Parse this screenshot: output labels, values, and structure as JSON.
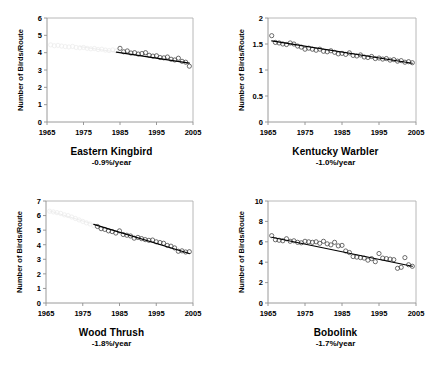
{
  "figure": {
    "type": "multi-panel-scatter",
    "panel_count": 4,
    "shared_ylabel": "Number of Birds/Route",
    "shared_xticks": [
      "1965",
      "1975",
      "1985",
      "1995",
      "2005"
    ],
    "marker_style": "open-circle",
    "line_style": "solid-linear-trend",
    "colors": {
      "marker_stroke": "#3d3d3d",
      "trend_line": "#000000",
      "axis": "#8f8f8f",
      "frame": "#b0b0b0",
      "background": "#ffffff",
      "text": "#000000"
    }
  },
  "panels": [
    {
      "id": "eastern-kingbird",
      "name": "Eastern Kingbird",
      "trend": "-0.9%/year",
      "ylabel": "Number of Birds/Route",
      "yticks": [
        "0",
        "1",
        "2",
        "3",
        "4",
        "5",
        "6"
      ]
    },
    {
      "id": "kentucky-warbler",
      "name": "Kentucky Warbler",
      "trend": "-1.0%/year",
      "ylabel": "Number of Birds/Route",
      "yticks": [
        "0",
        "0.5",
        "1",
        "1.5",
        "2"
      ]
    },
    {
      "id": "wood-thrush",
      "name": "Wood Thrush",
      "trend": "-1.8%/year",
      "ylabel": "Number of Birds/Route",
      "yticks": [
        "0",
        "1",
        "2",
        "3",
        "4",
        "5",
        "6",
        "7"
      ]
    },
    {
      "id": "bobolink",
      "name": "Bobolink",
      "trend": "-1.7%/year",
      "ylabel": "Number of Birds/Route",
      "yticks": [
        "0",
        "2",
        "4",
        "6",
        "8",
        "10"
      ]
    }
  ],
  "chart_data": [
    {
      "type": "scatter",
      "title": "Eastern Kingbird",
      "annotation": "-0.9%/year",
      "xlabel": "",
      "ylabel": "Number of Birds/Route",
      "xlim": [
        1965,
        2005
      ],
      "ylim": [
        0,
        6
      ],
      "xticks": [
        1965,
        1975,
        1985,
        1995,
        2005
      ],
      "yticks": [
        0,
        1,
        2,
        3,
        4,
        5,
        6
      ],
      "grid": false,
      "legend": null,
      "note": "left-hand portion of the series is printed very faintly",
      "x": [
        1966,
        1967,
        1968,
        1969,
        1970,
        1971,
        1972,
        1973,
        1974,
        1975,
        1976,
        1977,
        1978,
        1979,
        1980,
        1981,
        1982,
        1983,
        1984,
        1985,
        1986,
        1987,
        1988,
        1989,
        1990,
        1991,
        1992,
        1993,
        1994,
        1995,
        1996,
        1997,
        1998,
        1999,
        2000,
        2001,
        2002,
        2003,
        2004
      ],
      "y": [
        4.45,
        4.4,
        4.42,
        4.38,
        4.35,
        4.33,
        4.36,
        4.3,
        4.28,
        4.3,
        4.25,
        4.22,
        4.24,
        4.18,
        4.2,
        4.15,
        4.12,
        4.16,
        4.1,
        4.25,
        4.05,
        4.1,
        3.98,
        4.0,
        3.92,
        3.95,
        4.0,
        3.85,
        3.8,
        3.82,
        3.72,
        3.7,
        3.75,
        3.62,
        3.58,
        3.68,
        3.5,
        3.45,
        3.22
      ],
      "trend_line": {
        "x": [
          1974,
          2004
        ],
        "y": [
          4.35,
          3.4
        ]
      }
    },
    {
      "type": "scatter",
      "title": "Kentucky Warbler",
      "annotation": "-1.0%/year",
      "xlabel": "",
      "ylabel": "Number of Birds/Route",
      "xlim": [
        1965,
        2005
      ],
      "ylim": [
        0,
        2
      ],
      "xticks": [
        1965,
        1975,
        1985,
        1995,
        2005
      ],
      "yticks": [
        0,
        0.5,
        1,
        1.5,
        2
      ],
      "grid": false,
      "legend": null,
      "x": [
        1966,
        1967,
        1968,
        1969,
        1970,
        1971,
        1972,
        1973,
        1974,
        1975,
        1976,
        1977,
        1978,
        1979,
        1980,
        1981,
        1982,
        1983,
        1984,
        1985,
        1986,
        1987,
        1988,
        1989,
        1990,
        1991,
        1992,
        1993,
        1994,
        1995,
        1996,
        1997,
        1998,
        1999,
        2000,
        2001,
        2002,
        2003,
        2004
      ],
      "y": [
        1.66,
        1.53,
        1.52,
        1.5,
        1.49,
        1.52,
        1.5,
        1.46,
        1.44,
        1.4,
        1.42,
        1.4,
        1.38,
        1.4,
        1.36,
        1.35,
        1.37,
        1.34,
        1.31,
        1.32,
        1.3,
        1.33,
        1.28,
        1.27,
        1.29,
        1.25,
        1.24,
        1.26,
        1.22,
        1.23,
        1.21,
        1.22,
        1.19,
        1.2,
        1.17,
        1.18,
        1.15,
        1.16,
        1.14
      ],
      "trend_line": {
        "x": [
          1966,
          2004
        ],
        "y": [
          1.56,
          1.13
        ]
      }
    },
    {
      "type": "scatter",
      "title": "Wood Thrush",
      "annotation": "-1.8%/year",
      "xlabel": "",
      "ylabel": "Number of Birds/Route",
      "xlim": [
        1965,
        2005
      ],
      "ylim": [
        0,
        7
      ],
      "xticks": [
        1965,
        1975,
        1985,
        1995,
        2005
      ],
      "yticks": [
        0,
        1,
        2,
        3,
        4,
        5,
        6,
        7
      ],
      "grid": false,
      "legend": null,
      "note": "left-hand portion of the series is printed very faintly",
      "x": [
        1966,
        1967,
        1968,
        1969,
        1970,
        1971,
        1972,
        1973,
        1974,
        1975,
        1976,
        1977,
        1978,
        1979,
        1980,
        1981,
        1982,
        1983,
        1984,
        1985,
        1986,
        1987,
        1988,
        1989,
        1990,
        1991,
        1992,
        1993,
        1994,
        1995,
        1996,
        1997,
        1998,
        1999,
        2000,
        2001,
        2002,
        2003,
        2004
      ],
      "y": [
        6.3,
        6.25,
        6.2,
        6.15,
        6.05,
        6.0,
        5.9,
        5.8,
        5.7,
        5.6,
        5.5,
        5.42,
        5.3,
        5.25,
        5.1,
        5.05,
        4.95,
        4.9,
        4.8,
        4.95,
        4.7,
        4.65,
        4.6,
        4.45,
        4.5,
        4.42,
        4.35,
        4.3,
        4.32,
        4.2,
        4.15,
        4.1,
        3.95,
        3.9,
        3.78,
        3.55,
        3.58,
        3.5,
        3.52
      ],
      "trend_line": {
        "x": [
          1966,
          2004
        ],
        "y": [
          6.32,
          3.4
        ]
      }
    },
    {
      "type": "scatter",
      "title": "Bobolink",
      "annotation": "-1.7%/year",
      "xlabel": "",
      "ylabel": "Number of Birds/Route",
      "xlim": [
        1965,
        2005
      ],
      "ylim": [
        0,
        10
      ],
      "xticks": [
        1965,
        1975,
        1985,
        1995,
        2005
      ],
      "yticks": [
        0,
        2,
        4,
        6,
        8,
        10
      ],
      "grid": false,
      "legend": null,
      "x": [
        1966,
        1967,
        1968,
        1969,
        1970,
        1971,
        1972,
        1973,
        1974,
        1975,
        1976,
        1977,
        1978,
        1979,
        1980,
        1981,
        1982,
        1983,
        1984,
        1985,
        1986,
        1987,
        1988,
        1989,
        1990,
        1991,
        1992,
        1993,
        1994,
        1995,
        1996,
        1997,
        1998,
        1999,
        2000,
        2001,
        2002,
        2003,
        2004
      ],
      "y": [
        6.6,
        6.2,
        6.15,
        6.1,
        6.3,
        6.05,
        6.1,
        5.95,
        5.9,
        6.05,
        6.0,
        5.95,
        6.0,
        5.85,
        6.05,
        5.8,
        5.7,
        5.95,
        5.6,
        5.65,
        5.1,
        4.95,
        4.55,
        4.5,
        4.45,
        4.4,
        4.2,
        4.35,
        4.05,
        4.85,
        4.4,
        4.35,
        4.3,
        4.25,
        3.4,
        3.5,
        4.45,
        3.75,
        3.6
      ],
      "trend_line": {
        "x": [
          1966,
          2004
        ],
        "y": [
          6.45,
          3.6
        ]
      }
    }
  ]
}
